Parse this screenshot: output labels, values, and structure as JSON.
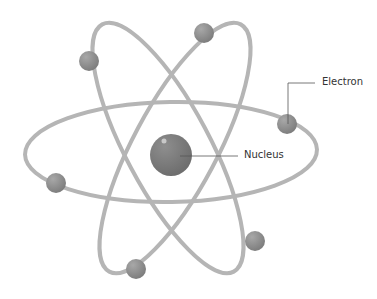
{
  "diagram": {
    "labels": {
      "electron": "Electron",
      "nucleus": "Nucleus"
    },
    "colors": {
      "orbit": "#b3b3b3",
      "particle": "#8a8a8a",
      "nucleus": "#7a7a7a",
      "leader": "#444444"
    },
    "electron_count": 6
  }
}
